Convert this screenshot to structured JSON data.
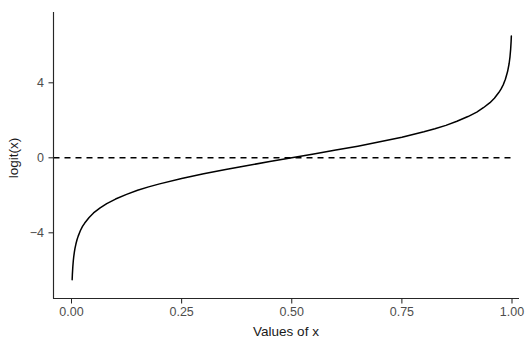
{
  "chart_data": {
    "type": "line",
    "title": "",
    "xlabel": "Values of x",
    "ylabel": "logit(x)",
    "xlim": [
      -0.02,
      1.02
    ],
    "ylim": [
      -6.6,
      6.6
    ],
    "grid": false,
    "legend": "none",
    "xticks": [
      0.0,
      0.25,
      0.5,
      0.75,
      1.0
    ],
    "xtick_labels": [
      "0.00",
      "0.25",
      "0.50",
      "0.75",
      "1.00"
    ],
    "yticks": [
      -4,
      0,
      4
    ],
    "ytick_labels": [
      "-4",
      "0",
      "4"
    ],
    "annotations": [
      {
        "kind": "hline",
        "y": 0,
        "style": "dashed",
        "color": "#000000"
      }
    ],
    "series": [
      {
        "name": "logit(x)",
        "color": "#000000",
        "style": "solid",
        "x": [
          0.0015,
          0.002,
          0.003,
          0.004,
          0.005,
          0.0065,
          0.008,
          0.01,
          0.0125,
          0.015,
          0.02,
          0.025,
          0.03,
          0.04,
          0.05,
          0.065,
          0.08,
          0.1,
          0.125,
          0.15,
          0.175,
          0.2,
          0.25,
          0.3,
          0.35,
          0.4,
          0.45,
          0.5,
          0.55,
          0.6,
          0.65,
          0.7,
          0.75,
          0.8,
          0.825,
          0.85,
          0.875,
          0.9,
          0.92,
          0.935,
          0.95,
          0.96,
          0.97,
          0.975,
          0.98,
          0.985,
          0.99,
          0.9935,
          0.9955,
          0.997,
          0.998,
          0.9985
        ],
        "y": [
          -6.5,
          -6.21,
          -5.81,
          -5.52,
          -5.29,
          -5.03,
          -4.82,
          -4.6,
          -4.37,
          -4.19,
          -3.89,
          -3.66,
          -3.48,
          -3.18,
          -2.94,
          -2.67,
          -2.44,
          -2.2,
          -1.95,
          -1.73,
          -1.55,
          -1.39,
          -1.1,
          -0.85,
          -0.62,
          -0.41,
          -0.2,
          0.0,
          0.2,
          0.41,
          0.62,
          0.85,
          1.1,
          1.39,
          1.55,
          1.73,
          1.95,
          2.2,
          2.44,
          2.67,
          2.94,
          3.18,
          3.48,
          3.66,
          3.89,
          4.19,
          4.6,
          5.03,
          5.4,
          5.81,
          6.21,
          6.5
        ]
      }
    ]
  },
  "axes": {
    "x_axis_name": "x-axis",
    "y_axis_name": "y-axis"
  }
}
